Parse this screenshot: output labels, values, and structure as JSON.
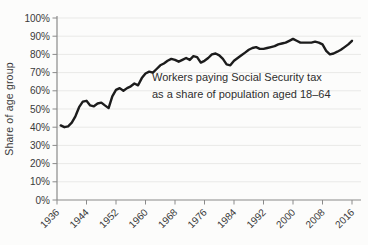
{
  "chart_data": {
    "type": "line",
    "title": "",
    "xlabel": "",
    "ylabel": "Share of age group",
    "annotation_line1": "Workers paying Social Security tax",
    "annotation_line2": "as a share of population aged 18–64",
    "x_ticks": [
      "1936",
      "1944",
      "1952",
      "1960",
      "1968",
      "1976",
      "1984",
      "1992",
      "2000",
      "2008",
      "2016"
    ],
    "y_ticks": [
      "0%",
      "10%",
      "20%",
      "30%",
      "40%",
      "50%",
      "60%",
      "70%",
      "80%",
      "90%",
      "100%"
    ],
    "xlim": [
      1936,
      2016
    ],
    "ylim": [
      0,
      100
    ],
    "grid": "horizontal",
    "legend": "none",
    "colors": {
      "line": "#1c1c1c",
      "axis": "#8a8a8a",
      "gridline": "#e9e9e7",
      "text": "#3a3a3a"
    },
    "series": [
      {
        "name": "Workers paying Social Security tax as a share of population aged 18–64",
        "x": [
          1937,
          1938,
          1939,
          1940,
          1941,
          1942,
          1943,
          1944,
          1945,
          1946,
          1947,
          1948,
          1949,
          1950,
          1951,
          1952,
          1953,
          1954,
          1955,
          1956,
          1957,
          1958,
          1959,
          1960,
          1961,
          1962,
          1963,
          1964,
          1965,
          1966,
          1967,
          1968,
          1969,
          1970,
          1971,
          1972,
          1973,
          1974,
          1975,
          1976,
          1977,
          1978,
          1979,
          1980,
          1981,
          1982,
          1983,
          1984,
          1985,
          1986,
          1987,
          1988,
          1989,
          1990,
          1991,
          1992,
          1993,
          1994,
          1995,
          1996,
          1997,
          1998,
          1999,
          2000,
          2001,
          2002,
          2003,
          2004,
          2005,
          2006,
          2007,
          2008,
          2009,
          2010,
          2011,
          2012,
          2013,
          2014,
          2015,
          2016
        ],
        "values": [
          41,
          40,
          40.5,
          42.5,
          46,
          51,
          54,
          54.5,
          52,
          51.5,
          53,
          53.5,
          52,
          50.5,
          57,
          60.5,
          61.5,
          60,
          61.5,
          62.5,
          64,
          63,
          67,
          69.5,
          70.5,
          70,
          72,
          74,
          75,
          76.5,
          77.5,
          77,
          76,
          77,
          78,
          77,
          79,
          78.5,
          75.5,
          76.5,
          78,
          80,
          80.5,
          79.5,
          77.5,
          74.5,
          74,
          76.5,
          78,
          79.5,
          81,
          82.5,
          83.5,
          84,
          83,
          83,
          83.5,
          84,
          84.5,
          85.5,
          86,
          86.5,
          87.5,
          88.5,
          87.5,
          86.5,
          86.5,
          86.5,
          86.5,
          87,
          86.5,
          85.5,
          82,
          80,
          80.5,
          81.5,
          82.5,
          84,
          85.5,
          87.5
        ]
      }
    ]
  }
}
